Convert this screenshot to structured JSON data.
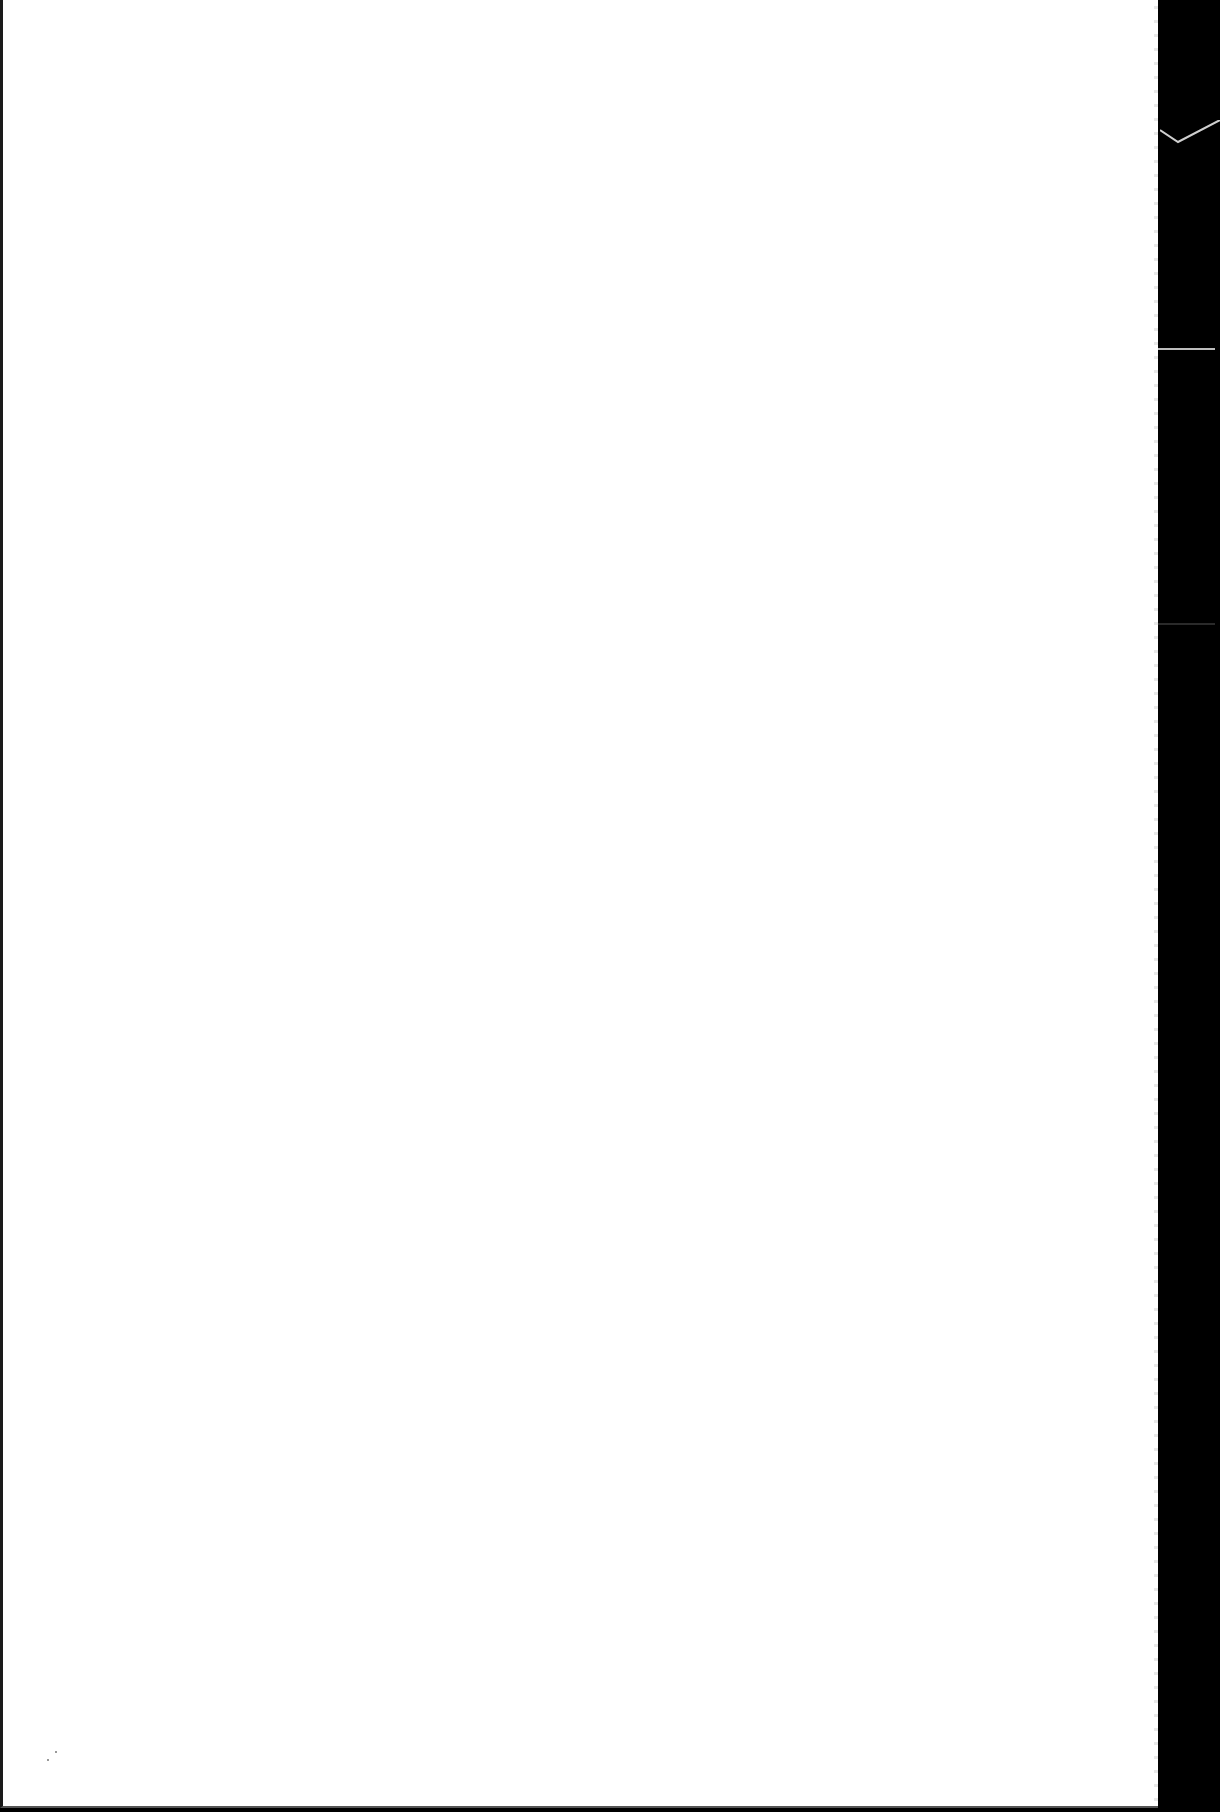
{
  "page": {
    "content": "",
    "is_blank": true,
    "background_color": "#ffffff",
    "backdrop_color": "#000000"
  }
}
